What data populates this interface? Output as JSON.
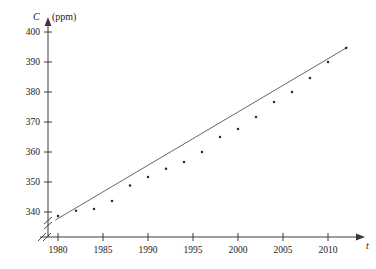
{
  "chart_data": {
    "type": "scatter",
    "title": "",
    "xlabel": "t",
    "ylabel": "C",
    "yunit": "(ppm)",
    "xlim": [
      1978.5,
      2012.5
    ],
    "ylim": [
      333,
      402
    ],
    "grid": false,
    "legend": null,
    "axis_break_x": true,
    "axis_break_y": true,
    "xticks": [
      1980,
      1985,
      1990,
      1995,
      2000,
      2005,
      2010
    ],
    "xticklabels": [
      "1980",
      "1985",
      "1990",
      "1995",
      "2000",
      "2005",
      "2010"
    ],
    "yticks": [
      340,
      350,
      360,
      370,
      380,
      390,
      400
    ],
    "yticklabels": [
      "340",
      "350",
      "360",
      "370",
      "380",
      "390",
      "400"
    ],
    "x": [
      1980,
      1982,
      1984,
      1986,
      1988,
      1990,
      1992,
      1994,
      1996,
      1998,
      2000,
      2002,
      2004,
      2006,
      2008,
      2010,
      2012
    ],
    "values": [
      338.7,
      340.4,
      341.0,
      343.7,
      348.8,
      351.7,
      354.4,
      356.7,
      360.0,
      365.0,
      367.7,
      371.7,
      376.7,
      380.0,
      384.7,
      390.0,
      394.7
    ],
    "series": [
      {
        "name": "observations",
        "marker": "dot",
        "color": "#2a2a2a",
        "points": [
          {
            "x": 1980,
            "y": 338.7
          },
          {
            "x": 1982,
            "y": 340.4
          },
          {
            "x": 1984,
            "y": 341.0
          },
          {
            "x": 1986,
            "y": 343.7
          },
          {
            "x": 1988,
            "y": 348.8
          },
          {
            "x": 1990,
            "y": 351.7
          },
          {
            "x": 1992,
            "y": 354.4
          },
          {
            "x": 1994,
            "y": 356.7
          },
          {
            "x": 1996,
            "y": 360.0
          },
          {
            "x": 1998,
            "y": 365.0
          },
          {
            "x": 2000,
            "y": 367.7
          },
          {
            "x": 2002,
            "y": 371.7
          },
          {
            "x": 2004,
            "y": 376.7
          },
          {
            "x": 2006,
            "y": 380.0
          },
          {
            "x": 2008,
            "y": 384.7
          },
          {
            "x": 2010,
            "y": 390.0
          },
          {
            "x": 2012,
            "y": 394.7
          }
        ]
      },
      {
        "name": "trend-line",
        "type": "line",
        "color": "#55555a",
        "endpoints": [
          {
            "x": 1979.7,
            "y": 337.3
          },
          {
            "x": 2012.2,
            "y": 395.0
          }
        ]
      }
    ]
  }
}
